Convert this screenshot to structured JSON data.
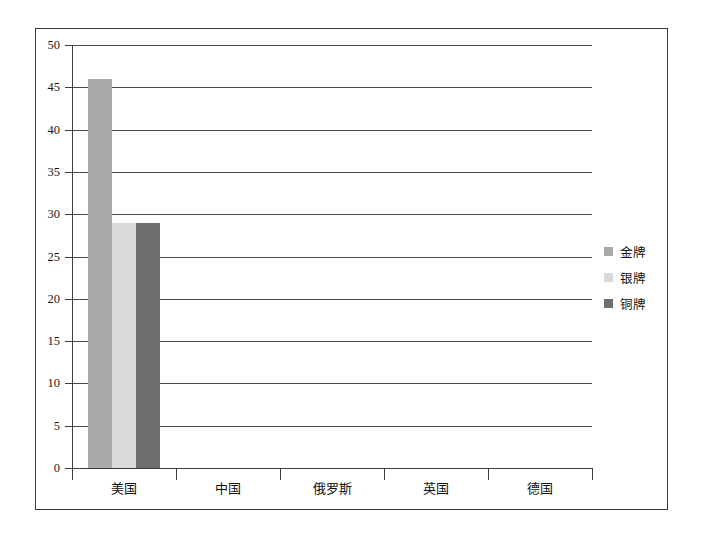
{
  "chart_data": {
    "type": "bar",
    "title": "",
    "xlabel": "",
    "ylabel": "",
    "categories": [
      "美国",
      "中国",
      "俄罗斯",
      "英国",
      "德国"
    ],
    "series": [
      {
        "name": "金牌",
        "color": "#a9a9a9",
        "values": [
          46,
          0,
          0,
          0,
          0
        ]
      },
      {
        "name": "银牌",
        "color": "#d9d9d9",
        "values": [
          29,
          0,
          0,
          0,
          0
        ]
      },
      {
        "name": "铜牌",
        "color": "#6e6e6e",
        "values": [
          29,
          0,
          0,
          0,
          0
        ]
      }
    ],
    "ylim": [
      0,
      50
    ],
    "ytick_step": 5,
    "yticks": [
      0,
      5,
      10,
      15,
      20,
      25,
      30,
      35,
      40,
      45,
      50
    ],
    "ytick_labels": [
      "0",
      "5",
      "10",
      "15",
      "20",
      "25",
      "30",
      "35",
      "40",
      "45",
      "50"
    ],
    "grid": true,
    "grid_axis": "y",
    "legend_position": "right",
    "frame_color": "#3a3a3a",
    "axis_color": "#3d3d3d",
    "gridline_color": "#4a4a4a",
    "background_color": "#ffffff"
  },
  "legend": {
    "items": [
      {
        "label": "金牌",
        "color": "#a9a9a9"
      },
      {
        "label": "银牌",
        "color": "#d9d9d9"
      },
      {
        "label": "铜牌",
        "color": "#6e6e6e"
      }
    ]
  }
}
